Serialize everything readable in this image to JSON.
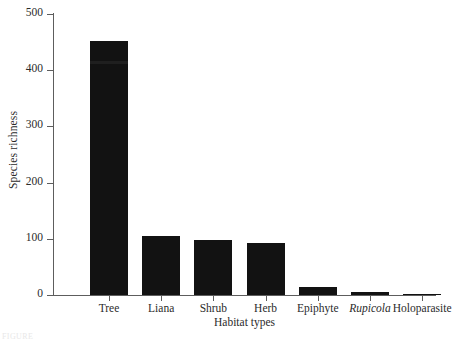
{
  "figure": {
    "background_color": "#ffffff",
    "bar_color": "#121212",
    "axis_color": "#5d5d5d",
    "text_color": "#2b2b2b",
    "caption_fragment": "FIGURE"
  },
  "chart_data": {
    "type": "bar",
    "title": "",
    "subtitle": "",
    "xlabel": "Habitat types",
    "ylabel": "Species richness",
    "categories": [
      "Tree",
      "Liana",
      "Shrub",
      "Herb",
      "Epiphyte",
      "Rupicola",
      "Holoparasite"
    ],
    "category_styles": [
      "normal",
      "normal",
      "normal",
      "normal",
      "normal",
      "italic",
      "normal"
    ],
    "values": [
      452,
      105,
      98,
      93,
      14,
      5,
      1
    ],
    "ylim": [
      0,
      500
    ],
    "yticks": [
      0,
      100,
      200,
      300,
      400,
      500
    ],
    "ytick_labels": [
      "0",
      "100",
      "200",
      "300",
      "400",
      "500"
    ],
    "grid": false,
    "legend": false,
    "legend_position": "none",
    "orientation": "vertical",
    "bar_color": "#121212"
  }
}
